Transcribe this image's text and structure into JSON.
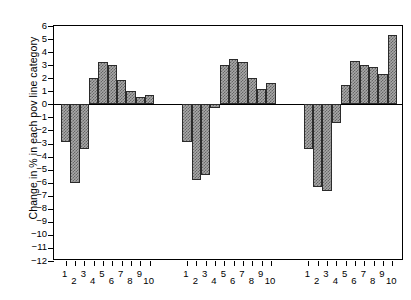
{
  "chart_data": {
    "type": "bar",
    "title": "",
    "subtitle": "",
    "xlabel": "",
    "ylabel": "Change in % in each pov line category",
    "ylim": [
      -12,
      6
    ],
    "yticks": [
      6,
      5,
      4,
      3,
      2,
      1,
      0,
      -1,
      -2,
      -3,
      -4,
      -5,
      -6,
      -7,
      -8,
      -9,
      -10,
      -11,
      -12
    ],
    "ytick_labels": [
      "6",
      "5",
      "4",
      "3",
      "2",
      "1",
      "0",
      "−1",
      "−2",
      "−3",
      "−4",
      "−5",
      "−6",
      "−7",
      "−8",
      "−9",
      "−10",
      "−11",
      "−12"
    ],
    "grid": false,
    "legend": "none",
    "categories": [
      "1",
      "2",
      "3",
      "4",
      "5",
      "6",
      "7",
      "8",
      "9",
      "10"
    ],
    "groups": [
      {
        "name": "group-1",
        "categories": [
          "1",
          "2",
          "3",
          "4",
          "5",
          "6",
          "7",
          "8",
          "9",
          "10"
        ],
        "values": [
          -2.9,
          -6.0,
          -3.4,
          2.0,
          3.25,
          3.0,
          1.85,
          1.0,
          0.55,
          0.75
        ]
      },
      {
        "name": "group-2",
        "categories": [
          "1",
          "2",
          "3",
          "4",
          "5",
          "6",
          "7",
          "8",
          "9",
          "10"
        ],
        "values": [
          -2.85,
          -5.8,
          -5.45,
          -0.25,
          3.05,
          3.45,
          3.25,
          2.05,
          1.2,
          1.6
        ]
      },
      {
        "name": "group-3",
        "categories": [
          "1",
          "2",
          "3",
          "4",
          "5",
          "6",
          "7",
          "8",
          "9",
          "10"
        ],
        "values": [
          -3.4,
          -6.3,
          -6.65,
          -1.45,
          1.45,
          3.3,
          3.05,
          2.85,
          2.35,
          5.3
        ]
      }
    ],
    "colors": {
      "bar_fill": "#a8a8a8",
      "bar_edge": "#2b2b2b",
      "axis": "#000000",
      "background": "#ffffff"
    }
  }
}
